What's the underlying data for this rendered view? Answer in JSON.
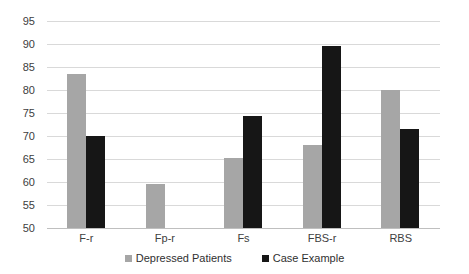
{
  "chart_data": {
    "type": "bar",
    "title": "",
    "subtitle": "",
    "xlabel": "",
    "ylabel": "",
    "categories": [
      "F-r",
      "Fp-r",
      "Fs",
      "FBS-r",
      "RBS"
    ],
    "series": [
      {
        "name": "Depressed Patients",
        "color": "#a6a6a6",
        "values": [
          83.5,
          59.5,
          65.3,
          68.0,
          80.0
        ]
      },
      {
        "name": "Case Example",
        "color": "#161616",
        "values": [
          70.0,
          null,
          74.3,
          89.5,
          71.5
        ]
      }
    ],
    "ylim": [
      50,
      95
    ],
    "ytick_step": 5,
    "yticks": [
      50,
      55,
      60,
      65,
      70,
      75,
      80,
      85,
      90,
      95
    ],
    "grid": true,
    "grid_axis": "y",
    "legend_position": "bottom",
    "colors": {
      "gridline": "#d9d9d9",
      "baseline": "#bfbfbf",
      "background": "#ffffff",
      "tick_text": "#404040",
      "legend_text": "#303030"
    }
  }
}
